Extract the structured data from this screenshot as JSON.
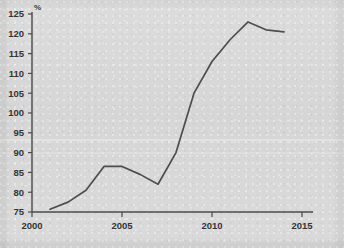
{
  "chart_data": {
    "type": "line",
    "title": "",
    "subtitle": "",
    "xlabel": "",
    "ylabel": "%",
    "unit_label": "%",
    "grid": false,
    "legend": "none",
    "xlim": [
      2000,
      2015
    ],
    "ylim": [
      75,
      125
    ],
    "x_ticks": [
      2000,
      2005,
      2010,
      2015
    ],
    "x_tick_labels": [
      "2000",
      "2005",
      "2010",
      "2015"
    ],
    "y_ticks": [
      75,
      80,
      85,
      90,
      95,
      100,
      105,
      110,
      115,
      120,
      125
    ],
    "y_tick_labels": [
      "75",
      "80",
      "85",
      "90",
      "95",
      "100",
      "105",
      "110",
      "115",
      "120",
      "125"
    ],
    "x": [
      2001,
      2002,
      2003,
      2004,
      2005,
      2006,
      2007,
      2008,
      2009,
      2010,
      2011,
      2012,
      2013,
      2014
    ],
    "series": [
      {
        "name": "index",
        "color": "#4d4d4d",
        "values": [
          75.7,
          77.5,
          80.5,
          86.5,
          86.5,
          84.5,
          82.0,
          90.0,
          105.0,
          113.0,
          118.5,
          123.0,
          121.0,
          120.5
        ]
      }
    ],
    "annotations": []
  },
  "axes": {
    "y_axis_x_px": 32,
    "x_axis_y_px": 212,
    "x_axis_end_px": 313,
    "y_axis_top_px": 12,
    "px_per_year": 18.0,
    "px_per_unit": 3.96
  },
  "colors": {
    "background": "#d8d8d8",
    "axis": "#4a4a4a",
    "line": "#4d4d4d",
    "text": "#343434"
  }
}
